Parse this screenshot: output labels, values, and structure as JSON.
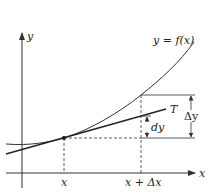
{
  "diagram": {
    "axes": {
      "x_label": "x",
      "y_label": "y"
    },
    "curve": {
      "label": "y = f(x)"
    },
    "tangent": {
      "label": "T"
    },
    "ticks": {
      "x0": "x",
      "x1": "x + Δx"
    },
    "increments": {
      "dy": "dy",
      "delta_y": "Δy"
    },
    "colors": {
      "line": "#333333",
      "background": "#ffffff"
    }
  }
}
